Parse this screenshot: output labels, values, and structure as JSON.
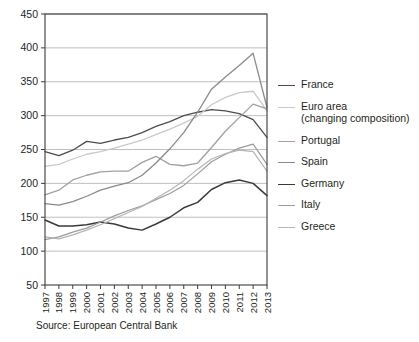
{
  "chart_data": {
    "type": "line",
    "title": "",
    "subtitle": "",
    "xlabel": "",
    "ylabel": "",
    "x": [
      1997,
      1998,
      1999,
      2000,
      2001,
      2002,
      2003,
      2004,
      2005,
      2006,
      2007,
      2008,
      2009,
      2010,
      2011,
      2012,
      2013
    ],
    "xtick_labels": [
      "1997",
      "1998",
      "1999",
      "2000",
      "2001",
      "2002",
      "2003",
      "2004",
      "2005",
      "2006",
      "2007",
      "2008",
      "2009",
      "2010",
      "2011",
      "2012",
      "2013"
    ],
    "ytick_labels": [
      "50",
      "100",
      "150",
      "200",
      "250",
      "300",
      "350",
      "400",
      "450"
    ],
    "yticks": [
      50,
      100,
      150,
      200,
      250,
      300,
      350,
      400,
      450
    ],
    "ylim": [
      50,
      450
    ],
    "xlim": [
      1997,
      2013
    ],
    "grid": true,
    "legend_position": "right",
    "series": [
      {
        "name": "France",
        "color": "#4d4d4d",
        "width": 1.3,
        "values": [
          247,
          241,
          249,
          262,
          259,
          264,
          268,
          275,
          284,
          291,
          300,
          305,
          309,
          307,
          303,
          294,
          268
        ]
      },
      {
        "name": "Euro area\n(changing composition)",
        "color": "#c9c9c9",
        "width": 1.3,
        "values": [
          225,
          228,
          236,
          243,
          247,
          252,
          258,
          264,
          272,
          280,
          289,
          299,
          316,
          327,
          334,
          336,
          307
        ]
      },
      {
        "name": "Portugal",
        "color": "#a0a0a0",
        "width": 1.3,
        "values": [
          183,
          190,
          205,
          212,
          217,
          218,
          218,
          231,
          240,
          228,
          226,
          230,
          253,
          277,
          297,
          317,
          310
        ]
      },
      {
        "name": "Spain",
        "color": "#8a8a8a",
        "width": 1.3,
        "values": [
          170,
          168,
          173,
          181,
          190,
          196,
          201,
          212,
          230,
          251,
          275,
          305,
          339,
          357,
          374,
          392,
          312
        ]
      },
      {
        "name": "Germany",
        "color": "#3a3a3a",
        "width": 1.5,
        "values": [
          146,
          137,
          137,
          139,
          143,
          140,
          134,
          131,
          140,
          150,
          164,
          172,
          191,
          201,
          205,
          200,
          182
        ]
      },
      {
        "name": "Italy",
        "color": "#9b9b9b",
        "width": 1.2,
        "values": [
          117,
          121,
          128,
          134,
          143,
          152,
          160,
          167,
          176,
          185,
          197,
          214,
          232,
          243,
          252,
          258,
          228
        ]
      },
      {
        "name": "Greece",
        "color": "#b5b5b5",
        "width": 1.2,
        "values": [
          121,
          118,
          124,
          131,
          139,
          148,
          157,
          166,
          178,
          190,
          204,
          221,
          236,
          244,
          249,
          247,
          218
        ]
      }
    ]
  },
  "legend": {
    "entries": [
      {
        "label": "France"
      },
      {
        "label": "Euro area\n(changing composition)"
      },
      {
        "label": "Portugal"
      },
      {
        "label": "Spain"
      },
      {
        "label": "Germany"
      },
      {
        "label": "Italy"
      },
      {
        "label": "Greece"
      }
    ]
  },
  "source": {
    "text": "Source: European Central Bank"
  },
  "colors": {
    "grid": "#b9b9b9",
    "frame": "#3b3b3b",
    "text": "#231f20",
    "background": "#ffffff"
  }
}
